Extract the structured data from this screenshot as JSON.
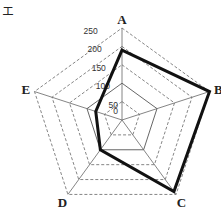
{
  "panel_label": "エ",
  "chart_data": {
    "type": "radar",
    "title": "",
    "categories": [
      "A",
      "B",
      "C",
      "D",
      "E"
    ],
    "series": [
      {
        "name": "series",
        "values": [
          190,
          250,
          240,
          100,
          75
        ],
        "color": "#111111"
      }
    ],
    "rmin": 0,
    "rmax": 250,
    "ticks": [
      0,
      50,
      100,
      150,
      200,
      250
    ],
    "tick_labels": [
      "0",
      "50",
      "100",
      "150",
      "200",
      "250"
    ],
    "solid_ring": 100,
    "grid": "dashed pentagon rings",
    "legend": null
  }
}
